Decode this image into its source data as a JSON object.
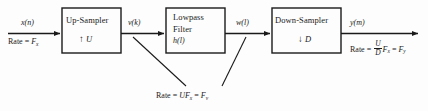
{
  "diagram": {
    "line_color": "#1a1a1a",
    "background": "#fdfdfd",
    "blocks": [
      {
        "id": "upsampler",
        "title": "Up-Sampler",
        "factor_glyph": "↑",
        "factor": "U"
      },
      {
        "id": "lowpass",
        "title_line1": "Lowpass",
        "title_line2": "Filter",
        "impulse_response": "h(l)"
      },
      {
        "id": "downsampler",
        "title": "Down-Sampler",
        "factor_glyph": "↓",
        "factor": "D"
      }
    ],
    "signals": {
      "input": "x(n)",
      "after_upsampler": "v(k)",
      "after_filter": "w(l)",
      "output": "y(m)"
    },
    "rates": {
      "input_label": "Rate = ",
      "input_value": "F",
      "input_sub": "x",
      "intermediate_label": "Rate = ",
      "intermediate_value": "UF",
      "intermediate_sub": "x",
      "intermediate_equals": " = ",
      "intermediate_value2": "F",
      "intermediate_sub2": "v",
      "output_label": "Rate = ",
      "output_num": "U",
      "output_den": "D",
      "output_value": "F",
      "output_sub": "x",
      "output_equals": " = ",
      "output_value2": "F",
      "output_sub2": "y"
    }
  }
}
